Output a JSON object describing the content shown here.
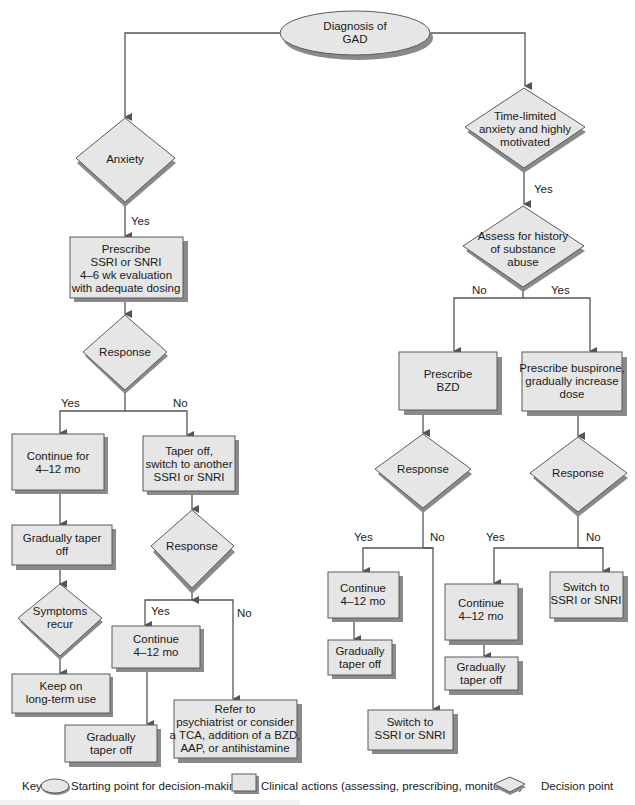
{
  "diagram": {
    "colors": {
      "node_fill": "#e6e6e6",
      "node_stroke": "#5a5a5a",
      "shadow": "#8a8a8a",
      "edge": "#555555",
      "text": "#1a1a1a"
    },
    "nodes": {
      "start": {
        "type": "start",
        "lines": [
          "Diagnosis of",
          "GAD"
        ]
      },
      "anxiety": {
        "type": "decision",
        "lines": [
          "Anxiety"
        ]
      },
      "prescribe_ssri": {
        "type": "action",
        "lines": [
          "Prescribe",
          "SSRI or SNRI",
          "4–6 wk evaluation",
          "with adequate dosing"
        ]
      },
      "response_l1": {
        "type": "decision",
        "lines": [
          "Response"
        ]
      },
      "continue_l1": {
        "type": "action",
        "lines": [
          "Continue for",
          "4–12 mo"
        ]
      },
      "taper_switch": {
        "type": "action",
        "lines": [
          "Taper off,",
          "switch to another",
          "SSRI or SNRI"
        ]
      },
      "gradual_l1": {
        "type": "action",
        "lines": [
          "Gradually taper",
          "off"
        ]
      },
      "symptoms_recur": {
        "type": "decision",
        "lines": [
          "Symptoms",
          "recur"
        ]
      },
      "keep_on": {
        "type": "action",
        "lines": [
          "Keep on",
          "long-term use"
        ]
      },
      "response_l2": {
        "type": "decision",
        "lines": [
          "Response"
        ]
      },
      "continue_l2": {
        "type": "action",
        "lines": [
          "Continue",
          "4–12 mo"
        ]
      },
      "gradual_l2": {
        "type": "action",
        "lines": [
          "Gradually",
          "taper off"
        ]
      },
      "refer": {
        "type": "action",
        "lines": [
          "Refer to",
          "psychiatrist or consider",
          "a TCA, addition of a BZD,",
          "AAP, or antihistamine"
        ]
      },
      "time_limited": {
        "type": "decision",
        "lines": [
          "Time-limited",
          "anxiety and highly",
          "motivated"
        ]
      },
      "assess_history": {
        "type": "decision",
        "lines": [
          "Assess for history",
          "of substance",
          "abuse"
        ]
      },
      "prescribe_bzd": {
        "type": "action",
        "lines": [
          "Prescribe",
          "BZD"
        ]
      },
      "prescribe_buspirone": {
        "type": "action",
        "lines": [
          "Prescribe buspirone,",
          "gradually increase",
          "dose"
        ]
      },
      "response_r1": {
        "type": "decision",
        "lines": [
          "Response"
        ]
      },
      "response_r2": {
        "type": "decision",
        "lines": [
          "Response"
        ]
      },
      "continue_r1": {
        "type": "action",
        "lines": [
          "Continue",
          "4–12 mo"
        ]
      },
      "gradual_r1": {
        "type": "action",
        "lines": [
          "Gradually",
          "taper off"
        ]
      },
      "switch_r1": {
        "type": "action",
        "lines": [
          "Switch to",
          "SSRI or SNRI"
        ]
      },
      "continue_r2": {
        "type": "action",
        "lines": [
          "Continue",
          "4–12 mo"
        ]
      },
      "gradual_r2": {
        "type": "action",
        "lines": [
          "Gradually",
          "taper off"
        ]
      },
      "switch_r2": {
        "type": "action",
        "lines": [
          "Switch to",
          "SSRI or SNRI"
        ]
      }
    },
    "edge_labels": {
      "anxiety_yes": "Yes",
      "response_l1_yes": "Yes",
      "response_l1_no": "No",
      "response_l2_yes": "Yes",
      "response_l2_no": "No",
      "time_limited_yes": "Yes",
      "assess_no": "No",
      "assess_yes": "Yes",
      "response_r1_yes": "Yes",
      "response_r1_no": "No",
      "response_r2_yes": "Yes",
      "response_r2_no": "No"
    },
    "edges": [
      [
        "start",
        "anxiety"
      ],
      [
        "start",
        "time_limited"
      ],
      [
        "anxiety",
        "prescribe_ssri",
        "Yes"
      ],
      [
        "prescribe_ssri",
        "response_l1"
      ],
      [
        "response_l1",
        "continue_l1",
        "Yes"
      ],
      [
        "response_l1",
        "taper_switch",
        "No"
      ],
      [
        "continue_l1",
        "gradual_l1"
      ],
      [
        "gradual_l1",
        "symptoms_recur"
      ],
      [
        "symptoms_recur",
        "keep_on"
      ],
      [
        "taper_switch",
        "response_l2"
      ],
      [
        "response_l2",
        "continue_l2",
        "Yes"
      ],
      [
        "response_l2",
        "refer",
        "No"
      ],
      [
        "continue_l2",
        "gradual_l2"
      ],
      [
        "time_limited",
        "assess_history",
        "Yes"
      ],
      [
        "assess_history",
        "prescribe_bzd",
        "No"
      ],
      [
        "assess_history",
        "prescribe_buspirone",
        "Yes"
      ],
      [
        "prescribe_bzd",
        "response_r1"
      ],
      [
        "response_r1",
        "continue_r1",
        "Yes"
      ],
      [
        "response_r1",
        "switch_r1",
        "No"
      ],
      [
        "continue_r1",
        "gradual_r1"
      ],
      [
        "prescribe_buspirone",
        "response_r2"
      ],
      [
        "response_r2",
        "continue_r2",
        "Yes"
      ],
      [
        "response_r2",
        "switch_r2",
        "No"
      ],
      [
        "continue_r2",
        "gradual_r2"
      ]
    ]
  },
  "key": {
    "label": "Key",
    "start": "Starting point for decision-making",
    "action": "Clinical actions (assessing, prescribing, monitoring)",
    "decision": "Decision point"
  }
}
